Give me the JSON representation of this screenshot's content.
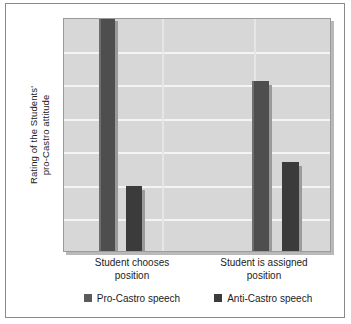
{
  "chart_data": {
    "type": "bar",
    "title": "",
    "xlabel": "",
    "ylabel_line1": "Rating of the Students'",
    "ylabel_line2": "pro-Castro attitude",
    "categories": [
      "Student chooses position",
      "Student is assigned position"
    ],
    "category_lines": [
      {
        "line1": "Student chooses",
        "line2": "position"
      },
      {
        "line1": "Student is assigned",
        "line2": "position"
      }
    ],
    "series": [
      {
        "name": "Pro-Castro speech",
        "color": "#4e4e4e",
        "values": [
          7.0,
          5.1
        ]
      },
      {
        "name": "Anti-Castro speech",
        "color": "#3b3b3b",
        "values": [
          1.95,
          2.65
        ]
      }
    ],
    "ylim": [
      0,
      7
    ],
    "y_ticks_shown": false,
    "gridlines": 6,
    "grid": true,
    "legend_position": "bottom"
  },
  "legend": {
    "items": [
      {
        "label": "Pro-Castro speech"
      },
      {
        "label": "Anti-Castro speech"
      }
    ]
  },
  "colors": {
    "plot_background": "#d7d7d7",
    "gridline": "#f4f4f4",
    "frame": "#8a8a8a",
    "pro_bar": "#4e4e4e",
    "anti_bar": "#3b3b3b",
    "text": "#1c1c1c"
  }
}
